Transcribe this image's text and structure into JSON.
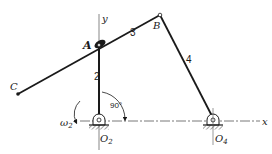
{
  "figure": {
    "type": "four-bar linkage mechanism",
    "colors": {
      "ink": "#1a1a1a",
      "background": "#ffffff"
    }
  },
  "axes": {
    "x_label": "x",
    "y_label": "y"
  },
  "points": {
    "A": {
      "label": "A",
      "x": 99,
      "y": 45
    },
    "B": {
      "label": "B",
      "x": 160,
      "y": 15
    },
    "C": {
      "label": "C",
      "x": 18,
      "y": 94
    },
    "O2": {
      "label": "O",
      "sub": "2",
      "x": 99,
      "y": 121
    },
    "O4": {
      "label": "O",
      "sub": "4",
      "x": 213,
      "y": 121
    }
  },
  "links": [
    {
      "id": "2",
      "label": "2",
      "from": "O2",
      "to": "A"
    },
    {
      "id": "3",
      "label": "3",
      "from": "C",
      "to": "B"
    },
    {
      "id": "4",
      "label": "4",
      "from": "B",
      "to": "O4"
    }
  ],
  "annotations": {
    "angle": "90°",
    "omega_symbol": "ω",
    "omega_sub": "2"
  }
}
